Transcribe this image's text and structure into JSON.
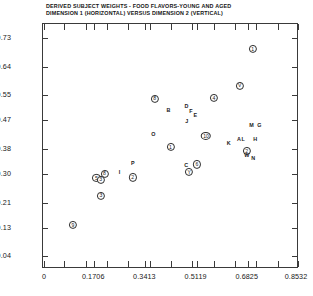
{
  "title": {
    "line1": "DERIVED SUBJECT WEIGHTS  -   FOOD FLAVORS-YOUNG AND AGED",
    "line2": "DIMENSION 1 (HORIZONTAL) VERSUS DIMENSION 2 (VERTICAL)"
  },
  "chart_data": {
    "type": "scatter",
    "title": "DERIVED SUBJECT WEIGHTS  -   FOOD FLAVORS-YOUNG AND AGED",
    "subtitle": "DIMENSION 1 (HORIZONTAL) VERSUS DIMENSION 2 (VERTICAL)",
    "xlabel": "",
    "ylabel": "",
    "grid": false,
    "legend": "none",
    "xlim": [
      0.0,
      0.8532
    ],
    "ylim": [
      0.0,
      0.775
    ],
    "xticks": [
      0,
      0.1706,
      0.3413,
      0.5119,
      0.6825,
      0.8532
    ],
    "xtick_labels": [
      "0",
      "0.1706",
      "0.3413",
      "0.5119",
      "0.6825",
      "0.8532"
    ],
    "yticks": [
      0.04,
      0.13,
      0.21,
      0.3,
      0.38,
      0.47,
      0.55,
      0.64,
      0.73
    ],
    "ytick_labels": [
      "0.04",
      "0.13",
      "0.21",
      "0.30",
      "0.38",
      "0.47",
      "0.55",
      "0.64",
      "0.73"
    ],
    "xtick_minor_count": 11,
    "marker_styles": {
      "circled": "aged subjects (circled labels)",
      "plain": "young subjects (plain letters)"
    },
    "points": [
      {
        "label": "1",
        "style": "circled",
        "x": 0.6985,
        "y": 0.695
      },
      {
        "label": "V",
        "style": "circled",
        "x": 0.656,
        "y": 0.58
      },
      {
        "label": "4",
        "style": "circled",
        "x": 0.57,
        "y": 0.54
      },
      {
        "label": "8",
        "style": "circled",
        "x": 0.372,
        "y": 0.539
      },
      {
        "label": "B",
        "style": "plain",
        "x": 0.4185,
        "y": 0.501
      },
      {
        "label": "D",
        "style": "plain",
        "x": 0.478,
        "y": 0.513
      },
      {
        "label": "F",
        "style": "plain",
        "x": 0.493,
        "y": 0.497
      },
      {
        "label": "E",
        "style": "plain",
        "x": 0.508,
        "y": 0.483
      },
      {
        "label": "J",
        "style": "plain",
        "x": 0.479,
        "y": 0.464
      },
      {
        "label": "M",
        "style": "plain",
        "x": 0.695,
        "y": 0.453
      },
      {
        "label": "G",
        "style": "plain",
        "x": 0.721,
        "y": 0.453
      },
      {
        "label": "O",
        "style": "plain",
        "x": 0.368,
        "y": 0.423
      },
      {
        "label": "10",
        "style": "circled",
        "x": 0.543,
        "y": 0.42
      },
      {
        "label": "A",
        "style": "plain",
        "x": 0.653,
        "y": 0.409
      },
      {
        "label": "L",
        "style": "plain",
        "x": 0.667,
        "y": 0.409
      },
      {
        "label": "H",
        "style": "plain",
        "x": 0.707,
        "y": 0.407
      },
      {
        "label": "K",
        "style": "plain",
        "x": 0.619,
        "y": 0.396
      },
      {
        "label": "1",
        "style": "circled",
        "x": 0.425,
        "y": 0.386
      },
      {
        "label": "2",
        "style": "circled",
        "x": 0.679,
        "y": 0.373
      },
      {
        "label": "W",
        "style": "plain",
        "x": 0.679,
        "y": 0.358
      },
      {
        "label": "N",
        "style": "plain",
        "x": 0.701,
        "y": 0.347
      },
      {
        "label": "C",
        "style": "plain",
        "x": 0.477,
        "y": 0.326
      },
      {
        "label": "6",
        "style": "circled",
        "x": 0.513,
        "y": 0.331
      },
      {
        "label": "Y",
        "style": "circled",
        "x": 0.487,
        "y": 0.306
      },
      {
        "label": "P",
        "style": "plain",
        "x": 0.299,
        "y": 0.332
      },
      {
        "label": "I",
        "style": "plain",
        "x": 0.255,
        "y": 0.304
      },
      {
        "label": "2",
        "style": "circled",
        "x": 0.299,
        "y": 0.29
      },
      {
        "label": "8",
        "style": "circled",
        "x": 0.205,
        "y": 0.301
      },
      {
        "label": "5",
        "style": "circled",
        "x": 0.178,
        "y": 0.287
      },
      {
        "label": "3",
        "style": "circled",
        "x": 0.192,
        "y": 0.283
      },
      {
        "label": "3",
        "style": "circled",
        "x": 0.193,
        "y": 0.232
      },
      {
        "label": "9",
        "style": "circled",
        "x": 0.0995,
        "y": 0.139
      }
    ]
  }
}
